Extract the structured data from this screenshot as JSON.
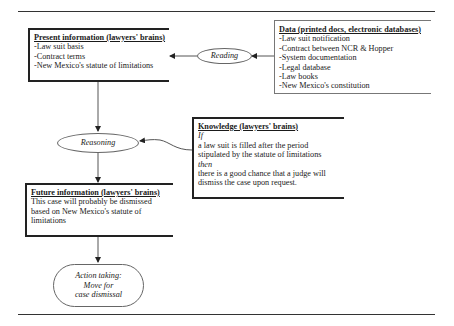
{
  "diagram": {
    "present_info": {
      "title": "Present information (lawyers' brains)",
      "items": [
        "-Law suit basis",
        "-Contract terms",
        "-New Mexico's statute of limitations"
      ]
    },
    "reading": {
      "label": "Reading"
    },
    "data": {
      "title": "Data  (printed docs, electronic databases)",
      "items": [
        "-Law suit notification",
        "-Contract between NCR & Hopper",
        "-System documentation",
        "-Legal database",
        "-Law books",
        "-New Mexico's constitution"
      ]
    },
    "reasoning": {
      "label": "Reasoning"
    },
    "knowledge": {
      "title": "Knowledge (lawyers' brains)",
      "if_label": "If",
      "condition": [
        "a law suit is filled after the period",
        "stipulated by the statute of limitations"
      ],
      "then_label": "then",
      "consequence": [
        "there is a good chance that a judge will",
        "dismiss the case upon request."
      ]
    },
    "future_info": {
      "title": "Future information (lawyers' brains)",
      "lines": [
        "This case will probably be dismissed",
        "based on New Mexico's statute of",
        "limitations"
      ]
    },
    "action": {
      "lines": [
        "Action taking:",
        "Move for",
        "case dismissal"
      ]
    }
  }
}
